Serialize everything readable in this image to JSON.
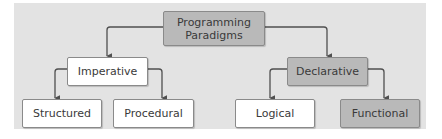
{
  "diagram": {
    "type": "tree",
    "colors": {
      "panel_background": "#e3e3e3",
      "highlight_fill": "#b9b9b9",
      "plain_fill": "#ffffff",
      "border": "#8a8a8a",
      "connector": "#505050",
      "text": "#3a3a3a"
    },
    "root": {
      "label": "Programming\nParadigms",
      "style": "gray"
    },
    "level1": [
      {
        "label": "Imperative",
        "style": "white"
      },
      {
        "label": "Declarative",
        "style": "gray"
      }
    ],
    "level2": [
      {
        "label": "Structured",
        "parent": "Imperative",
        "style": "white"
      },
      {
        "label": "Procedural",
        "parent": "Imperative",
        "style": "white"
      },
      {
        "label": "Logical",
        "parent": "Declarative",
        "style": "white"
      },
      {
        "label": "Functional",
        "parent": "Declarative",
        "style": "gray"
      }
    ],
    "edges": [
      {
        "from": "Programming Paradigms",
        "to": "Imperative"
      },
      {
        "from": "Programming Paradigms",
        "to": "Declarative"
      },
      {
        "from": "Imperative",
        "to": "Structured"
      },
      {
        "from": "Imperative",
        "to": "Procedural"
      },
      {
        "from": "Declarative",
        "to": "Logical"
      },
      {
        "from": "Declarative",
        "to": "Functional"
      }
    ]
  }
}
